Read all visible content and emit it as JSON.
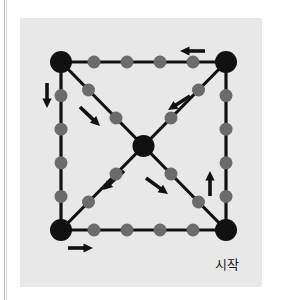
{
  "figure": {
    "background_color": "#e8e8e8",
    "page_color": "#ffffff",
    "rule_color": "#b9b9b9",
    "caption": "시작",
    "caption_meaning": "start",
    "colors": {
      "major_node": "#111111",
      "minor_node": "#6b6b6b",
      "edge": "#111111",
      "arrow": "#111111"
    },
    "geometry": {
      "viewbox": "0 0 242 269",
      "major_node_radius": 11,
      "minor_node_radius": 6.5,
      "edge_width": 3.2,
      "square": {
        "left": 41,
        "top": 44,
        "right": 206,
        "bottom": 212
      },
      "center": {
        "x": 123.5,
        "y": 128
      }
    },
    "major_nodes": [
      {
        "name": "corner-top-left",
        "x": 41,
        "y": 44
      },
      {
        "name": "corner-top-right",
        "x": 206,
        "y": 44
      },
      {
        "name": "corner-bottom-left",
        "x": 41,
        "y": 212
      },
      {
        "name": "corner-bottom-right",
        "x": 206,
        "y": 212
      },
      {
        "name": "center",
        "x": 123.5,
        "y": 128
      }
    ],
    "edges": [
      {
        "name": "edge-top",
        "x1": 41,
        "y1": 44,
        "x2": 206,
        "y2": 44,
        "minor_count": 4
      },
      {
        "name": "edge-left",
        "x1": 41,
        "y1": 44,
        "x2": 41,
        "y2": 212,
        "minor_count": 4
      },
      {
        "name": "edge-right",
        "x1": 206,
        "y1": 44,
        "x2": 206,
        "y2": 212,
        "minor_count": 4
      },
      {
        "name": "edge-bottom",
        "x1": 41,
        "y1": 212,
        "x2": 206,
        "y2": 212,
        "minor_count": 4
      },
      {
        "name": "diagonal-top-left-to-center",
        "x1": 41,
        "y1": 44,
        "x2": 123.5,
        "y2": 128,
        "minor_count": 2
      },
      {
        "name": "diagonal-top-right-to-center",
        "x1": 206,
        "y1": 44,
        "x2": 123.5,
        "y2": 128,
        "minor_count": 2
      },
      {
        "name": "diagonal-bottom-left-to-center",
        "x1": 41,
        "y1": 212,
        "x2": 123.5,
        "y2": 128,
        "minor_count": 2
      },
      {
        "name": "diagonal-bottom-right-to-center",
        "x1": 206,
        "y1": 212,
        "x2": 123.5,
        "y2": 128,
        "minor_count": 2
      }
    ],
    "arrows": [
      {
        "name": "arrow-top-edge-leftward",
        "x1": 185,
        "y1": 33,
        "x2": 160,
        "y2": 33,
        "direction": "left"
      },
      {
        "name": "arrow-left-edge-downward",
        "x1": 27,
        "y1": 65,
        "x2": 27,
        "y2": 90,
        "direction": "down"
      },
      {
        "name": "arrow-right-edge-upward",
        "x1": 190,
        "y1": 178,
        "x2": 190,
        "y2": 153,
        "direction": "up"
      },
      {
        "name": "arrow-bottom-edge-rightward",
        "x1": 48,
        "y1": 230,
        "x2": 73,
        "y2": 230,
        "direction": "right"
      },
      {
        "name": "arrow-diagonal-upper-left-down-right",
        "x1": 60,
        "y1": 89,
        "x2": 80,
        "y2": 108,
        "direction": "down-right"
      },
      {
        "name": "arrow-diagonal-upper-right-down-left",
        "x1": 170,
        "y1": 78,
        "x2": 148,
        "y2": 92,
        "direction": "down-left"
      },
      {
        "name": "arrow-diagonal-lower-left-down-left",
        "x1": 104,
        "y1": 153,
        "x2": 83,
        "y2": 172,
        "direction": "down-left"
      },
      {
        "name": "arrow-diagonal-lower-right-down-right",
        "x1": 126,
        "y1": 160,
        "x2": 148,
        "y2": 176,
        "direction": "down-right"
      }
    ]
  }
}
